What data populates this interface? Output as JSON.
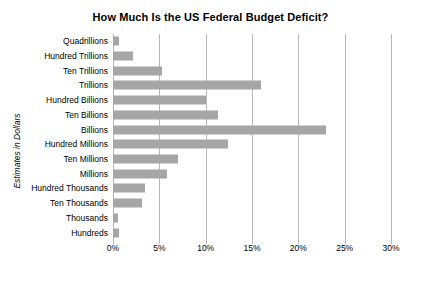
{
  "chart_data": {
    "type": "bar",
    "orientation": "horizontal",
    "title": "How Much Is the US Federal Budget Deficit?",
    "xlabel": "",
    "ylabel": "Estimates in Dollars",
    "categories": [
      "Quadrillions",
      "Hundred Trillions",
      "Ten Trillions",
      "Trillions",
      "Hundred Billions",
      "Ten Billions",
      "Billions",
      "Hundred Millions",
      "Ten Millions",
      "Millions",
      "Hundred Thousands",
      "Ten Thousands",
      "Thousands",
      "Hundreds"
    ],
    "values": [
      0.6,
      2.2,
      5.3,
      16.0,
      10.0,
      11.3,
      23.0,
      12.4,
      7.0,
      5.8,
      3.4,
      3.1,
      0.5,
      0.7
    ],
    "value_suffix": "%",
    "xlim": [
      0,
      30
    ],
    "xticks": [
      0,
      5,
      10,
      15,
      20,
      25,
      30
    ],
    "xtick_labels": [
      "0%",
      "5%",
      "10%",
      "15%",
      "20%",
      "25%",
      "30%"
    ],
    "grid": true,
    "legend": false,
    "bar_color": "#a6a6a6",
    "gridline_color": "#b8b8b8",
    "background_color": "#ffffff"
  }
}
